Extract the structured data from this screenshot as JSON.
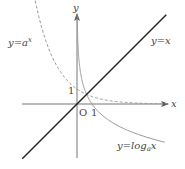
{
  "diagram": {
    "title": "",
    "base_a_assumed": 0.5,
    "axes": {
      "x_label": "x",
      "y_label": "y",
      "origin_label": "O",
      "x_tick_label": "1",
      "y_tick_label": "1"
    },
    "curves": [
      {
        "id": "identity",
        "label": "y=x",
        "style": "solid",
        "color": "#222222"
      },
      {
        "id": "exponential",
        "label_main": "y=a",
        "label_sup": "x",
        "style": "dashed",
        "color": "#999999"
      },
      {
        "id": "logarithm",
        "label_main": "y=log",
        "label_sub": "a",
        "label_tail": "x",
        "style": "solid",
        "color": "#999999"
      }
    ],
    "colors": {
      "axis": "#666666",
      "text": "#444444"
    }
  }
}
